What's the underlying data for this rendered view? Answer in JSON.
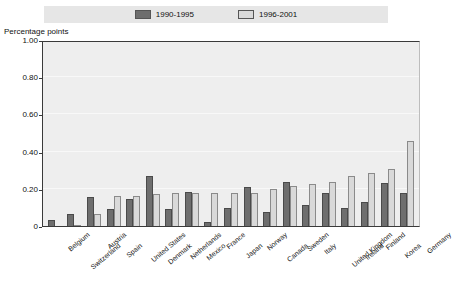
{
  "legend": {
    "items": [
      {
        "label": "1990-1995",
        "color": "#6e6e6e",
        "style": "dark"
      },
      {
        "label": "1996-2001",
        "color": "#d9d9d9",
        "style": "light"
      }
    ]
  },
  "axis": {
    "ylabel": "Percentage points",
    "yticks": [
      "0",
      "0.20",
      "0.40",
      "0.60",
      "0.80",
      "1.00"
    ]
  },
  "chart_data": {
    "type": "bar",
    "title": "",
    "xlabel": "",
    "ylabel": "Percentage points",
    "ylim": [
      0,
      1.0
    ],
    "ytick_values": [
      0,
      0.2,
      0.4,
      0.6,
      0.8,
      1.0
    ],
    "grid": true,
    "legend_position": "top",
    "categories": [
      "Belgium",
      "Switzerland",
      "Austria",
      "Spain",
      "United States",
      "Denmark",
      "Netherlands",
      "Mexico",
      "France",
      "Japan",
      "Norway",
      "Canada",
      "Sweden",
      "Italy",
      "United Kingdom",
      "Ireland",
      "Finland",
      "Korea",
      "Germany"
    ],
    "series": [
      {
        "name": "1990-1995",
        "color": "#6e6e6e",
        "values": [
          0.035,
          0.065,
          0.155,
          0.09,
          0.145,
          0.27,
          0.09,
          0.185,
          0.02,
          0.095,
          0.21,
          0.075,
          0.235,
          0.115,
          0.18,
          0.095,
          0.13,
          0.23,
          0.175
        ]
      },
      {
        "name": "1996-2001",
        "color": "#d9d9d9",
        "values": [
          0.0,
          0.005,
          0.065,
          0.16,
          0.16,
          0.17,
          0.175,
          0.175,
          0.175,
          0.18,
          0.18,
          0.2,
          0.215,
          0.225,
          0.235,
          0.27,
          0.285,
          0.305,
          0.455
        ]
      }
    ]
  }
}
